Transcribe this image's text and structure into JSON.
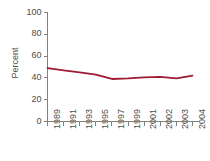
{
  "chart_data": {
    "type": "line",
    "title": "",
    "xlabel": "",
    "ylabel": "Percent",
    "categories": [
      "1989",
      "1991",
      "1993",
      "1995",
      "1997",
      "1999",
      "2001",
      "2002",
      "2003",
      "2004"
    ],
    "series": [
      {
        "name": "Percent",
        "values": [
          49,
          47,
          45,
          43,
          39,
          39.5,
          40.5,
          41,
          39.5,
          42
        ],
        "color": "#9E1B32"
      }
    ],
    "ylim": [
      0,
      100
    ],
    "yticks": [
      0,
      20,
      40,
      60,
      80,
      100
    ],
    "ytick_labels": [
      "0",
      "20",
      "40",
      "60",
      "80",
      "100"
    ],
    "grid": false,
    "legend": "none",
    "axis_color": "#808080",
    "text_color": "#4d4d4d",
    "background": "#ffffff"
  },
  "axes": {
    "y_label": "Percent",
    "y_ticks": [
      "0",
      "20",
      "40",
      "60",
      "80",
      "100"
    ],
    "x_ticks": [
      "1989",
      "1991",
      "1993",
      "1995",
      "1997",
      "1999",
      "2001",
      "2002",
      "2003",
      "2004"
    ]
  }
}
